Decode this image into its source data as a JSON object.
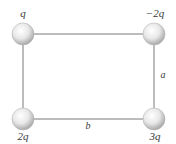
{
  "diagram": {
    "type": "charge-rectangle",
    "colors": {
      "line": "#7a7a7a",
      "sphere_light": "#ffffff",
      "sphere_mid": "#e6e6e6",
      "sphere_dark": "#a8a8a8",
      "text": "#3a3a3a"
    },
    "charges": [
      {
        "id": "top-left",
        "label": "q"
      },
      {
        "id": "top-right",
        "label": "−2q"
      },
      {
        "id": "bottom-left",
        "label": "2q"
      },
      {
        "id": "bottom-right",
        "label": "3q"
      }
    ],
    "dimensions": {
      "side_right": "a",
      "side_bottom": "b"
    }
  }
}
